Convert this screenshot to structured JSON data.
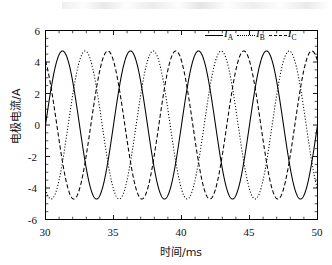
{
  "chart_data": {
    "type": "line",
    "title": "",
    "xlabel": "时间/ms",
    "ylabel": "电极电流/A",
    "xlim": [
      30,
      50
    ],
    "ylim": [
      -6,
      6
    ],
    "xticks": [
      30,
      35,
      40,
      45,
      50
    ],
    "yticks": [
      -6,
      -4,
      -2,
      0,
      2,
      4,
      6
    ],
    "grid": false,
    "legend_position": "top-right",
    "amplitude": 4.7,
    "period_ms": 5.0,
    "frequency_hz": 200,
    "series": [
      {
        "name": "I_A",
        "label": "I",
        "sub": "A",
        "style": "solid",
        "color": "#000000",
        "amplitude": 4.7,
        "period_ms": 5.0,
        "phase_deg": 0
      },
      {
        "name": "I_B",
        "label": "I",
        "sub": "B",
        "style": "dotted",
        "color": "#000000",
        "amplitude": 4.7,
        "period_ms": 5.0,
        "phase_deg": -120
      },
      {
        "name": "I_C",
        "label": "I",
        "sub": "C",
        "style": "dashed",
        "color": "#000000",
        "amplitude": 4.7,
        "period_ms": 5.0,
        "phase_deg": 120
      }
    ]
  },
  "axes": {
    "y_label": "电极电流/A",
    "x_label": "时间/ms",
    "y_tick_labels": [
      "6",
      "4",
      "2",
      "0",
      "-2",
      "-4",
      "-6"
    ],
    "x_tick_labels": [
      "30",
      "35",
      "40",
      "45",
      "50"
    ]
  },
  "legend": {
    "items": [
      {
        "label": "I",
        "sub": "A",
        "style": "solid"
      },
      {
        "label": "I",
        "sub": "B",
        "style": "dotted"
      },
      {
        "label": "I",
        "sub": "C",
        "style": "dashed"
      }
    ]
  }
}
